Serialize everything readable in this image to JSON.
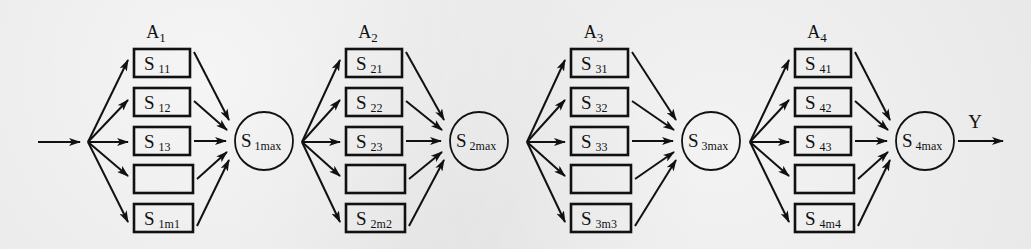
{
  "diagram": {
    "input_arrow": {
      "label": ""
    },
    "output_label": "Y",
    "stages": [
      {
        "group_label": "A",
        "group_index": "1",
        "boxes": [
          {
            "main": "S",
            "sub": "11"
          },
          {
            "main": "S",
            "sub": "12"
          },
          {
            "main": "S",
            "sub": "13"
          },
          {
            "main": "",
            "sub": ""
          },
          {
            "main": "S",
            "sub": "1m1"
          }
        ],
        "max_node": {
          "main": "S",
          "sub": "1max"
        }
      },
      {
        "group_label": "A",
        "group_index": "2",
        "boxes": [
          {
            "main": "S",
            "sub": "21"
          },
          {
            "main": "S",
            "sub": "22"
          },
          {
            "main": "S",
            "sub": "23"
          },
          {
            "main": "",
            "sub": ""
          },
          {
            "main": "S",
            "sub": "2m2"
          }
        ],
        "max_node": {
          "main": "S",
          "sub": "2max"
        }
      },
      {
        "group_label": "A",
        "group_index": "3",
        "boxes": [
          {
            "main": "S",
            "sub": "31"
          },
          {
            "main": "S",
            "sub": "32"
          },
          {
            "main": "S",
            "sub": "33"
          },
          {
            "main": "",
            "sub": ""
          },
          {
            "main": "S",
            "sub": "3m3"
          }
        ],
        "max_node": {
          "main": "S",
          "sub": "3max"
        }
      },
      {
        "group_label": "A",
        "group_index": "4",
        "boxes": [
          {
            "main": "S",
            "sub": "41"
          },
          {
            "main": "S",
            "sub": "42"
          },
          {
            "main": "S",
            "sub": "43"
          },
          {
            "main": "",
            "sub": ""
          },
          {
            "main": "S",
            "sub": "4m4"
          }
        ],
        "max_node": {
          "main": "S",
          "sub": "4max"
        }
      }
    ],
    "colors": {
      "stroke": "#111111",
      "background": "#e9e9e9"
    }
  }
}
